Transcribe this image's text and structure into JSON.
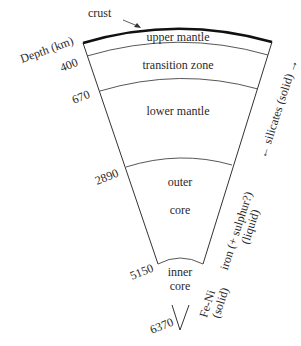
{
  "labels": {
    "crust": "crust",
    "depth_axis": "Depth (km)",
    "layers": {
      "upper_mantle": "upper mantle",
      "transition_zone": "transition zone",
      "lower_mantle": "lower mantle",
      "outer_core_1": "outer",
      "outer_core_2": "core",
      "inner_core_1": "inner",
      "inner_core_2": "core"
    },
    "depths": {
      "d400": "400",
      "d670": "670",
      "d2890": "2890",
      "d5150": "5150",
      "d6370": "6370"
    },
    "composition": {
      "silicates": "← silicates (solid) →",
      "iron_1": "iron (+ sulphur?)",
      "iron_2": "(liquid)",
      "feni_1": "Fe-Ni",
      "feni_2": "(solid)"
    }
  }
}
